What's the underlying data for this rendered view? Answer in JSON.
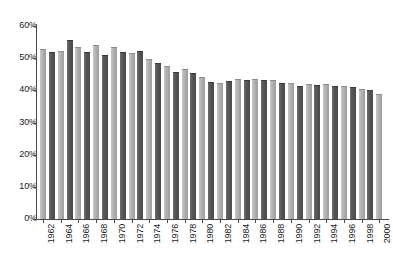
{
  "chart_data": {
    "type": "bar",
    "title": "",
    "subtitle": "",
    "xlabel": "",
    "ylabel": "",
    "ylim": [
      0,
      60
    ],
    "ytick_labels": [
      "60%",
      "50%",
      "40%",
      "30%",
      "20%",
      "10%",
      "0%"
    ],
    "ytick_values": [
      60,
      50,
      40,
      30,
      20,
      10,
      0
    ],
    "grid": false,
    "legend": null,
    "legend_position": "none",
    "value_suffix": "%",
    "categories": [
      "1962",
      "1963",
      "1964",
      "1965",
      "1966",
      "1967",
      "1968",
      "1969",
      "1970",
      "1971",
      "1972",
      "1973",
      "1974",
      "1975",
      "1976",
      "1977",
      "1978",
      "1979",
      "1980",
      "1981",
      "1982",
      "1983",
      "1984",
      "1985",
      "1986",
      "1987",
      "1988",
      "1989",
      "1990",
      "1991",
      "1992",
      "1993",
      "1994",
      "1995",
      "1996",
      "1997",
      "1998",
      "1999",
      "2000"
    ],
    "visible_tick_labels": [
      "1962",
      "1964",
      "1966",
      "1968",
      "1970",
      "1972",
      "1974",
      "1976",
      "1978",
      "1980",
      "1982",
      "1984",
      "1986",
      "1988",
      "1990",
      "1992",
      "1994",
      "1996",
      "1998",
      "2000"
    ],
    "values": [
      52.8,
      52.0,
      52.3,
      55.5,
      53.5,
      52.0,
      54.0,
      51.0,
      53.5,
      52.0,
      51.5,
      52.3,
      49.8,
      48.5,
      47.7,
      45.7,
      46.5,
      45.5,
      44.0,
      42.5,
      42.3,
      43.0,
      43.5,
      43.2,
      43.5,
      43.2,
      43.3,
      42.2,
      42.3,
      41.5,
      42.0,
      41.8,
      42.0,
      41.5,
      41.3,
      41.0,
      40.5,
      40.0,
      39.0
    ],
    "series_colors": {
      "light_bar": "#b4b4b4",
      "dark_bar": "#565656"
    },
    "axis_color": "#4a4a4a",
    "text_color": "#1a1a1a",
    "background": "#ffffff"
  }
}
